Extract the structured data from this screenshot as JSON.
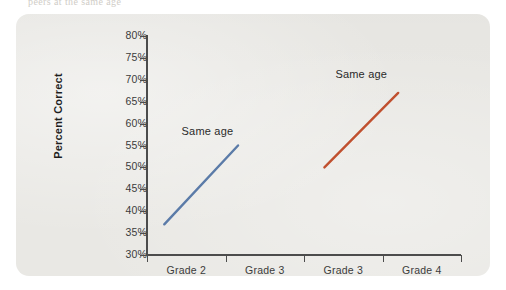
{
  "page": {
    "bleed_top_text": "peers at the same age"
  },
  "figure": {
    "y_axis_title": "Percent Correct",
    "y_ticks": [
      "80%",
      "75%",
      "70%",
      "65%",
      "60%",
      "55%",
      "50%",
      "45%",
      "40%",
      "35%",
      "30%"
    ],
    "x_categories": [
      "Grade 2",
      "Grade 3",
      "Grade 3",
      "Grade 4"
    ],
    "annotations": [
      {
        "text": "Same age",
        "series": "blue"
      },
      {
        "text": "Same age",
        "series": "red"
      }
    ],
    "colors": {
      "panel_background": "#e9e8e4",
      "axis": "#4c4c4c",
      "series_blue": "#5b7ba8",
      "series_red": "#c0502f",
      "text": "#3b3b3b"
    }
  },
  "chart_data": {
    "type": "line",
    "title": "",
    "subtitle": "",
    "xlabel": "",
    "ylabel": "Percent Correct",
    "categories": [
      "Grade 2",
      "Grade 3",
      "Grade 3",
      "Grade 4"
    ],
    "ylim": [
      30,
      80
    ],
    "ytick_values": [
      30,
      35,
      40,
      45,
      50,
      55,
      60,
      65,
      70,
      75,
      80
    ],
    "ytick_labels": [
      "30%",
      "35%",
      "40%",
      "45%",
      "50%",
      "55%",
      "60%",
      "65%",
      "70%",
      "75%",
      "80%"
    ],
    "ytick_format": "percent",
    "grid": false,
    "legend": "none",
    "annotations": [
      {
        "text": "Same age",
        "series": "Same age (Grades 2-3)",
        "x_frac": 0.11,
        "y_value": 58
      },
      {
        "text": "Same age",
        "series": "Same age (Grades 3-4)",
        "x_frac": 0.6,
        "y_value": 71
      }
    ],
    "series": [
      {
        "name": "Same age (Grades 2-3)",
        "color": "#5b7ba8",
        "spans_categories": [
          "Grade 2",
          "Grade 3"
        ],
        "points": [
          {
            "x_label": "Grade 2",
            "x_frac": 0.055,
            "y": 37
          },
          {
            "x_label": "Grade 3",
            "x_frac": 0.29,
            "y": 55
          }
        ],
        "start_value": 37,
        "end_value": 55,
        "change": 18
      },
      {
        "name": "Same age (Grades 3-4)",
        "color": "#c0502f",
        "spans_categories": [
          "Grade 3",
          "Grade 4"
        ],
        "points": [
          {
            "x_label": "Grade 3",
            "x_frac": 0.565,
            "y": 50
          },
          {
            "x_label": "Grade 4",
            "x_frac": 0.8,
            "y": 67
          }
        ],
        "start_value": 50,
        "end_value": 67,
        "change": 17
      }
    ]
  }
}
